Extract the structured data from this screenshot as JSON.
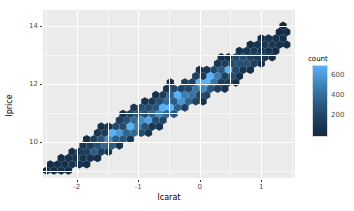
{
  "chart_data": {
    "type": "heatmap",
    "subtype": "hexbin",
    "title": "",
    "xlabel": "lcarat",
    "ylabel": "lprice",
    "xlim": [
      -2.55,
      1.55
    ],
    "ylim": [
      8.75,
      14.55
    ],
    "xticks": [
      -2,
      -1,
      0,
      1
    ],
    "xticklabels": [
      "-2",
      "-1",
      "0",
      "1"
    ],
    "yticks": [
      10,
      12,
      14
    ],
    "yticklabels": [
      "10",
      "12",
      "14"
    ],
    "grid": true,
    "panel_background": "#ebebeb",
    "gridline_color": "#ffffff",
    "legend": {
      "title": "count",
      "position": "right",
      "ticks": [
        200,
        400,
        600
      ],
      "ticklabels": [
        "200",
        "400",
        "600"
      ],
      "range": [
        0,
        700
      ],
      "low_color": "#132b43",
      "high_color": "#56b1f7",
      "bar_top_color": "#4a72a8",
      "bar_bottom_color": "#14122a"
    },
    "bins": [
      {
        "x": -2.45,
        "y": 9.05,
        "count": 30
      },
      {
        "x": -2.38,
        "y": 9.15,
        "count": 45
      },
      {
        "x": -2.32,
        "y": 8.95,
        "count": 25
      },
      {
        "x": -2.28,
        "y": 9.3,
        "count": 60
      },
      {
        "x": -2.22,
        "y": 9.1,
        "count": 70
      },
      {
        "x": -2.18,
        "y": 9.4,
        "count": 85
      },
      {
        "x": -2.12,
        "y": 9.22,
        "count": 110
      },
      {
        "x": -2.08,
        "y": 9.52,
        "count": 95
      },
      {
        "x": -2.02,
        "y": 9.35,
        "count": 150
      },
      {
        "x": -1.98,
        "y": 9.62,
        "count": 130
      },
      {
        "x": -1.92,
        "y": 9.48,
        "count": 200
      },
      {
        "x": -1.88,
        "y": 9.75,
        "count": 175
      },
      {
        "x": -1.82,
        "y": 9.58,
        "count": 260
      },
      {
        "x": -1.78,
        "y": 9.88,
        "count": 210
      },
      {
        "x": -1.72,
        "y": 9.7,
        "count": 330
      },
      {
        "x": -1.68,
        "y": 10.0,
        "count": 255
      },
      {
        "x": -1.62,
        "y": 9.82,
        "count": 390
      },
      {
        "x": -1.58,
        "y": 10.12,
        "count": 300
      },
      {
        "x": -1.52,
        "y": 9.95,
        "count": 430
      },
      {
        "x": -1.48,
        "y": 10.25,
        "count": 340
      },
      {
        "x": -1.42,
        "y": 10.05,
        "count": 470
      },
      {
        "x": -1.38,
        "y": 10.35,
        "count": 360
      },
      {
        "x": -1.32,
        "y": 10.18,
        "count": 500
      },
      {
        "x": -1.28,
        "y": 10.48,
        "count": 380
      },
      {
        "x": -1.22,
        "y": 10.3,
        "count": 520
      },
      {
        "x": -1.18,
        "y": 10.6,
        "count": 400
      },
      {
        "x": -1.12,
        "y": 10.42,
        "count": 540
      },
      {
        "x": -1.08,
        "y": 10.72,
        "count": 420
      },
      {
        "x": -1.02,
        "y": 10.55,
        "count": 560
      },
      {
        "x": -0.98,
        "y": 10.85,
        "count": 440
      },
      {
        "x": -0.92,
        "y": 10.68,
        "count": 580
      },
      {
        "x": -0.88,
        "y": 10.98,
        "count": 460
      },
      {
        "x": -0.82,
        "y": 10.8,
        "count": 600
      },
      {
        "x": -0.78,
        "y": 11.1,
        "count": 470
      },
      {
        "x": -0.72,
        "y": 10.92,
        "count": 610
      },
      {
        "x": -0.68,
        "y": 11.22,
        "count": 480
      },
      {
        "x": -0.62,
        "y": 11.05,
        "count": 620
      },
      {
        "x": -0.58,
        "y": 11.35,
        "count": 490
      },
      {
        "x": -0.52,
        "y": 11.18,
        "count": 600
      },
      {
        "x": -0.48,
        "y": 11.48,
        "count": 470
      },
      {
        "x": -0.42,
        "y": 11.3,
        "count": 580
      },
      {
        "x": -0.38,
        "y": 11.6,
        "count": 450
      },
      {
        "x": -0.32,
        "y": 11.42,
        "count": 560
      },
      {
        "x": -0.28,
        "y": 11.72,
        "count": 430
      },
      {
        "x": -0.22,
        "y": 11.55,
        "count": 530
      },
      {
        "x": -0.18,
        "y": 11.85,
        "count": 410
      },
      {
        "x": -0.12,
        "y": 11.68,
        "count": 500
      },
      {
        "x": -0.08,
        "y": 11.98,
        "count": 390
      },
      {
        "x": 0.02,
        "y": 11.82,
        "count": 470
      },
      {
        "x": 0.08,
        "y": 12.1,
        "count": 360
      },
      {
        "x": 0.15,
        "y": 12.0,
        "count": 430
      },
      {
        "x": 0.22,
        "y": 12.3,
        "count": 330
      },
      {
        "x": 0.3,
        "y": 12.2,
        "count": 390
      },
      {
        "x": 0.38,
        "y": 12.5,
        "count": 300
      },
      {
        "x": 0.48,
        "y": 12.42,
        "count": 340
      },
      {
        "x": 0.56,
        "y": 12.72,
        "count": 260
      },
      {
        "x": 0.66,
        "y": 12.62,
        "count": 290
      },
      {
        "x": 0.74,
        "y": 12.92,
        "count": 220
      },
      {
        "x": 0.84,
        "y": 12.85,
        "count": 240
      },
      {
        "x": 0.92,
        "y": 13.12,
        "count": 180
      },
      {
        "x": 1.02,
        "y": 13.05,
        "count": 190
      },
      {
        "x": 1.1,
        "y": 13.32,
        "count": 140
      },
      {
        "x": 1.2,
        "y": 13.25,
        "count": 120
      },
      {
        "x": 1.3,
        "y": 13.5,
        "count": 80
      },
      {
        "x": 1.38,
        "y": 13.62,
        "count": 50
      }
    ]
  }
}
